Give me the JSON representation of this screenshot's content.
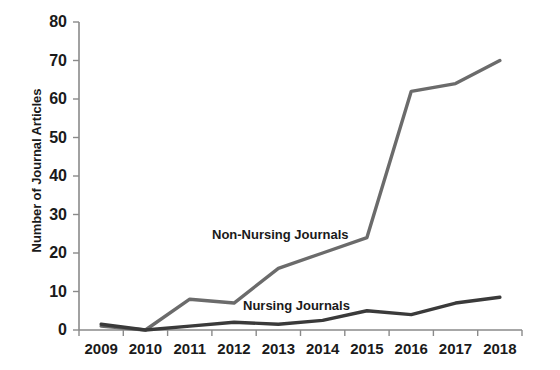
{
  "chart_data": {
    "type": "line",
    "title": "",
    "xlabel": "",
    "ylabel": "Number of Journal Articles",
    "categories": [
      "2009",
      "2010",
      "2011",
      "2012",
      "2013",
      "2014",
      "2015",
      "2016",
      "2017",
      "2018"
    ],
    "ylim": [
      0,
      80
    ],
    "yticks": [
      0,
      10,
      20,
      30,
      40,
      50,
      60,
      70,
      80
    ],
    "grid": false,
    "legend_position": "inline-annotation",
    "series": [
      {
        "name": "Non-Nursing Journals",
        "color": "#6b6b6b",
        "values": [
          1,
          0,
          8,
          7,
          16,
          20,
          24,
          62,
          64,
          70
        ]
      },
      {
        "name": "Nursing Journals",
        "color": "#3a3a3a",
        "values": [
          1.5,
          0,
          1,
          2,
          1.5,
          2.5,
          5,
          4,
          7,
          8.5
        ]
      }
    ],
    "annotations": [
      {
        "text": "Non-Nursing Journals",
        "series": "Non-Nursing Journals"
      },
      {
        "text": "Nursing Journals",
        "series": "Nursing Journals"
      }
    ]
  },
  "axis": {
    "y_title": "Number of Journal Articles",
    "y_tick_labels": [
      "80",
      "70",
      "60",
      "50",
      "40",
      "30",
      "20",
      "10",
      "0"
    ],
    "x_tick_labels": [
      "2009",
      "2010",
      "2011",
      "2012",
      "2013",
      "2014",
      "2015",
      "2016",
      "2017",
      "2018"
    ]
  },
  "labels": {
    "non_nursing": "Non-Nursing Journals",
    "nursing": "Nursing Journals"
  }
}
